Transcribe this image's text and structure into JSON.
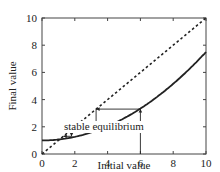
{
  "chart_data": {
    "type": "line",
    "title": "",
    "xlabel": "Initial value",
    "ylabel": "Final value",
    "xlim": [
      0,
      10
    ],
    "ylim": [
      0,
      10
    ],
    "xticks": [
      0,
      2,
      4,
      6,
      8,
      10
    ],
    "yticks": [
      0,
      2,
      4,
      6,
      8,
      10
    ],
    "grid": false,
    "legend": null,
    "series": [
      {
        "name": "identity line (y = x)",
        "style": "dotted",
        "x": [
          0,
          10
        ],
        "y": [
          0,
          10
        ]
      },
      {
        "name": "update curve",
        "style": "solid",
        "x": [
          0,
          1,
          2,
          3,
          4,
          5,
          6,
          7,
          8,
          9,
          10
        ],
        "y": [
          1.0,
          1.07,
          1.26,
          1.59,
          2.06,
          2.66,
          3.3,
          4.2,
          5.2,
          6.3,
          7.5
        ]
      }
    ],
    "cobweb": {
      "start": 6,
      "points": [
        [
          6,
          0
        ],
        [
          6,
          3.3
        ],
        [
          3.3,
          3.3
        ],
        [
          3.3,
          1.8
        ],
        [
          1.8,
          1.8
        ],
        [
          1.8,
          1.3
        ],
        [
          1.3,
          1.3
        ]
      ]
    },
    "annotations": [
      {
        "text": "stable equilibrium",
        "x": 1.2,
        "y": 1.2
      }
    ]
  }
}
